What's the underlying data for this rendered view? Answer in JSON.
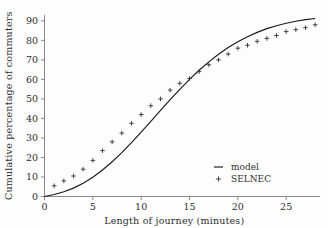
{
  "chart_data": {
    "type": "scatter",
    "title": "",
    "subtitle": "",
    "xlabel": "Length of journey (minutes)",
    "ylabel": "Cumulative percentage of commuters",
    "xlim": [
      0,
      28.5
    ],
    "ylim": [
      0,
      93
    ],
    "grid": false,
    "legend_position": "bottom-right",
    "xticks": [
      0,
      5,
      10,
      15,
      20,
      25
    ],
    "xtick_labels": [
      "0",
      "5",
      "10",
      "15",
      "20",
      "25"
    ],
    "yticks": [
      0,
      10,
      20,
      30,
      40,
      50,
      60,
      70,
      80,
      90
    ],
    "ytick_labels": [
      "0",
      "10",
      "20",
      "30",
      "40",
      "50",
      "60",
      "70",
      "80",
      "90"
    ],
    "series": [
      {
        "name": "model",
        "type": "line",
        "marker": "none",
        "color": "#1a1a1a",
        "x": [
          0,
          1,
          2,
          3,
          4,
          5,
          6,
          7,
          8,
          9,
          10,
          11,
          12,
          13,
          14,
          15,
          16,
          17,
          18,
          19,
          20,
          21,
          22,
          23,
          24,
          25,
          26,
          27,
          28
        ],
        "y": [
          0,
          1.0,
          2.4,
          4.3,
          6.8,
          9.9,
          13.6,
          17.8,
          22.5,
          27.6,
          33.0,
          38.5,
          44.1,
          49.6,
          54.9,
          60.0,
          64.7,
          69.0,
          72.9,
          76.3,
          79.3,
          81.9,
          84.1,
          86.0,
          87.5,
          88.8,
          89.8,
          90.6,
          91.2
        ]
      },
      {
        "name": "SELNEC",
        "type": "scatter",
        "marker": "plus",
        "color": "#2a2a2a",
        "x": [
          1,
          2,
          3,
          4,
          5,
          6,
          7,
          8,
          9,
          10,
          11,
          12,
          13,
          14,
          15,
          16,
          17,
          18,
          19,
          20,
          21,
          22,
          23,
          24,
          25,
          26,
          27,
          28
        ],
        "y": [
          5.5,
          8.0,
          10.5,
          14.0,
          18.5,
          23.5,
          28.0,
          32.5,
          37.5,
          42.0,
          46.5,
          50.0,
          54.5,
          58.0,
          60.5,
          64.0,
          67.5,
          70.0,
          73.0,
          76.0,
          77.5,
          79.5,
          81.0,
          82.5,
          84.5,
          85.5,
          86.5,
          88.0
        ]
      }
    ],
    "legend_entries": [
      {
        "label": "model",
        "symbol": "line"
      },
      {
        "label": "SELNEC",
        "symbol": "plus"
      }
    ]
  }
}
